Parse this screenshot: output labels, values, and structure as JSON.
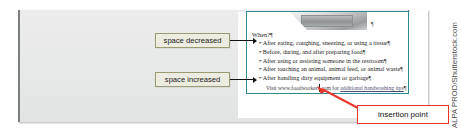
{
  "figure": {
    "type": "word-document-screenshot-with-callouts",
    "watermark": "ALPA PROD/Shutterstock.com"
  },
  "callouts": {
    "space_decreased": "space decreased",
    "space_increased": "space increased",
    "insertion_point": "insertion point"
  },
  "document": {
    "heading": "When?",
    "pilcrow": "¶",
    "bullet_mark": "•",
    "bullets": [
      "After eating, coughing, sneezing, or using a tissue",
      "Before, during, and after preparing food",
      "After using or assisting someone in the restroom",
      "After touching an animal, animal feed, or animal waste",
      "After handling dirty equipment or garbage"
    ],
    "link_line": {
      "prefix": "Visit www.foodworkers.com for ",
      "link_text": "additional handwashing tips",
      "suffix": " "
    },
    "picture_anchor": "¶"
  },
  "colors": {
    "teal_frame": "#2e8a96",
    "callout_fill": "#edece0",
    "callout_border": "#9b9b72",
    "insertion_red": "#e8372a",
    "page_gray": "#e9eaea",
    "paper_white": "#ffffff"
  }
}
